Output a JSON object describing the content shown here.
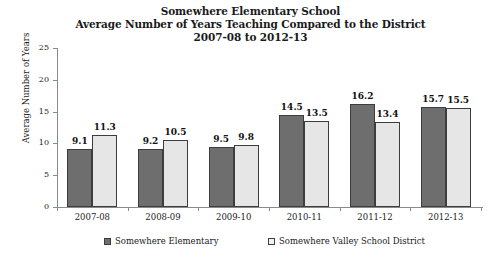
{
  "chart_data": {
    "type": "bar",
    "title": "Somewhere Elementary School Average Number of Years Teaching Compared to the District 2007-08 to 2012-13",
    "title_lines": [
      "Somewhere Elementary School",
      "Average Number of Years Teaching Compared to the District",
      "2007-08 to 2012-13"
    ],
    "xlabel": "",
    "ylabel": "Average Number of Years",
    "ylim": [
      0,
      25
    ],
    "ytick_labels": [
      "0",
      "5",
      "10",
      "15",
      "20",
      "25"
    ],
    "ytick_values": [
      0,
      5,
      10,
      15,
      20,
      25
    ],
    "grid": false,
    "legend_position": "bottom",
    "categories": [
      "2007-08",
      "2008-09",
      "2009-10",
      "2010-11",
      "2011-12",
      "2012-13"
    ],
    "series": [
      {
        "name": "Somewhere Elementary",
        "color": "#6e6e6e",
        "values": [
          9.1,
          9.2,
          9.5,
          14.5,
          16.2,
          15.7
        ],
        "value_labels": [
          "9.1",
          "9.2",
          "9.5",
          "14.5",
          "16.2",
          "15.7"
        ]
      },
      {
        "name": "Somewhere Valley School District",
        "color": "#e6e6e6",
        "values": [
          11.3,
          10.5,
          9.8,
          13.5,
          13.4,
          15.5
        ],
        "value_labels": [
          "11.3",
          "10.5",
          "9.8",
          "13.5",
          "13.4",
          "15.5"
        ]
      }
    ]
  },
  "colors": {
    "series_dark": "#6e6e6e",
    "series_light": "#e6e6e6",
    "outline": "#3d3d3d",
    "axis": "#8a8a8a",
    "text": "#1a1a1a",
    "background": "#ffffff"
  }
}
